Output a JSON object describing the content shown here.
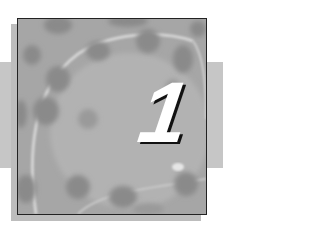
{
  "chapter": {
    "number": "1"
  },
  "image": {
    "subject": "grayscale-micrograph-cells",
    "colors": {
      "background": "#ffffff",
      "band": "#c6c6c6",
      "shadow": "#bdbdbd",
      "frame_border": "#222222",
      "numeral": "#ffffff",
      "numeral_shadow": "#111111"
    }
  }
}
